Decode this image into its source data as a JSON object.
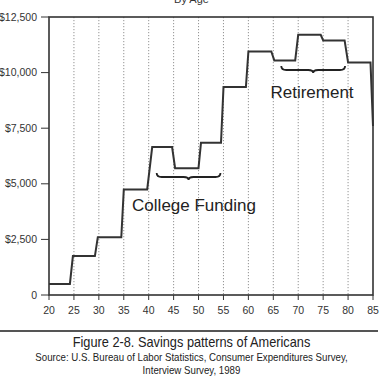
{
  "chart_data": {
    "type": "line",
    "subtitle": "By Age",
    "title": "Figure 2-8. Savings patterns of Americans",
    "source_line1": "Source: U.S. Bureau of Labor Statistics, Consumer Expenditures Survey,",
    "source_line2": "Interview Survey, 1989",
    "xlabel": "",
    "ylabel": "",
    "xlim": [
      20,
      85
    ],
    "ylim": [
      0,
      12500
    ],
    "x_ticks": [
      "20",
      "25",
      "30",
      "35",
      "40",
      "45",
      "50",
      "55",
      "60",
      "65",
      "70",
      "75",
      "80",
      "85"
    ],
    "y_ticks": [
      {
        "value": 0,
        "label": "0"
      },
      {
        "value": 2500,
        "label": "$2,500"
      },
      {
        "value": 5000,
        "label": "$5,000"
      },
      {
        "value": 7500,
        "label": "$7,500"
      },
      {
        "value": 10000,
        "label": "$10,000"
      },
      {
        "value": 12500,
        "label": "$12,500"
      }
    ],
    "grid": "vertical dotted at each x tick",
    "series": [
      {
        "name": "Savings",
        "step_ranges": [
          {
            "from": 20,
            "to": 25,
            "value": 500
          },
          {
            "from": 25,
            "to": 30,
            "value": 1750
          },
          {
            "from": 30,
            "to": 35,
            "value": 2600
          },
          {
            "from": 35,
            "to": 40,
            "value": 4750
          },
          {
            "from": 40,
            "to": 45,
            "value": 6650
          },
          {
            "from": 45,
            "to": 50,
            "value": 5700
          },
          {
            "from": 50,
            "to": 55,
            "value": 6850
          },
          {
            "from": 55,
            "to": 60,
            "value": 9350
          },
          {
            "from": 60,
            "to": 65,
            "value": 10950
          },
          {
            "from": 65,
            "to": 70,
            "value": 10550
          },
          {
            "from": 70,
            "to": 75,
            "value": 11700
          },
          {
            "from": 75,
            "to": 80,
            "value": 11450
          },
          {
            "from": 80,
            "to": 85,
            "value": 10450
          }
        ],
        "end_value": 7600,
        "points": [
          [
            20,
            500
          ],
          [
            24.2,
            500
          ],
          [
            24.8,
            1750
          ],
          [
            29.2,
            1750
          ],
          [
            29.8,
            2600
          ],
          [
            34.5,
            2600
          ],
          [
            35,
            4750
          ],
          [
            39.7,
            4750
          ],
          [
            40.7,
            6650
          ],
          [
            44.7,
            6650
          ],
          [
            45.3,
            5700
          ],
          [
            50,
            5700
          ],
          [
            50.5,
            6850
          ],
          [
            54.5,
            6850
          ],
          [
            55,
            9350
          ],
          [
            59.5,
            9350
          ],
          [
            60,
            10950
          ],
          [
            64.6,
            10950
          ],
          [
            65.2,
            10550
          ],
          [
            69.4,
            10550
          ],
          [
            70,
            11700
          ],
          [
            74.5,
            11700
          ],
          [
            75,
            11450
          ],
          [
            79.3,
            11450
          ],
          [
            80,
            10450
          ],
          [
            84.5,
            10450
          ],
          [
            85,
            7600
          ]
        ]
      }
    ],
    "annotations": [
      {
        "text": "College Funding",
        "span": [
          42,
          54
        ]
      },
      {
        "text": "Retirement",
        "span": [
          67,
          79
        ]
      }
    ]
  }
}
